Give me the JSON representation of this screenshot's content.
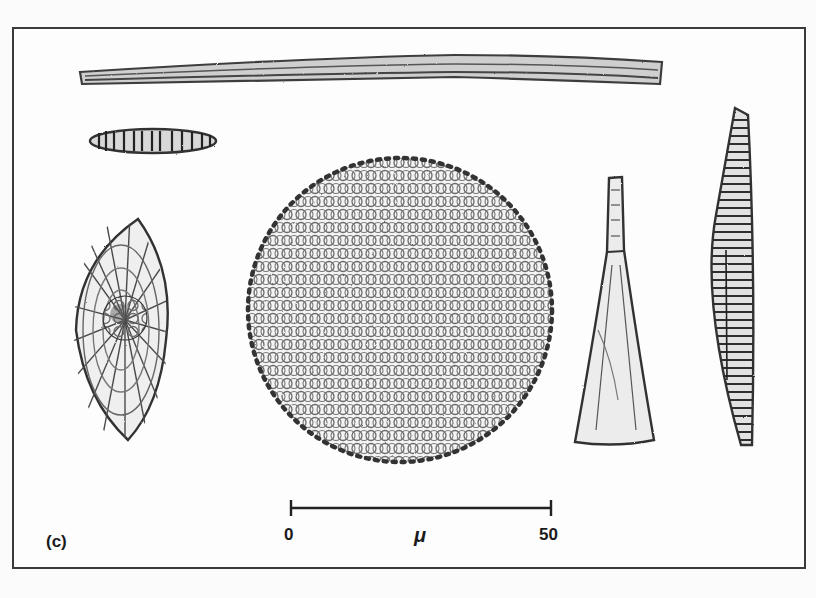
{
  "figure": {
    "panel_label": "(c)",
    "specimens": [
      {
        "name": "needle-diatom",
        "shape": "long thin rod",
        "position": "top"
      },
      {
        "name": "small-elliptical-diatom",
        "shape": "small striated ellipse",
        "position": "upper-left"
      },
      {
        "name": "lens-shaped-diatom",
        "shape": "oval with radial striae and reticulate center",
        "position": "left"
      },
      {
        "name": "centric-diatom",
        "shape": "circular, areolate valve with marginal spines",
        "position": "center"
      },
      {
        "name": "wedge-shaped-diatom",
        "shape": "tapering wedge / cuneate",
        "position": "center-right"
      },
      {
        "name": "spindle-diatom",
        "shape": "lanceolate with transverse costae",
        "position": "right"
      }
    ]
  },
  "scale_bar": {
    "start_label": "0",
    "end_label": "50",
    "unit": "μ"
  },
  "colors": {
    "ink": "#3a3a3a",
    "paper": "#fdfdfd"
  }
}
